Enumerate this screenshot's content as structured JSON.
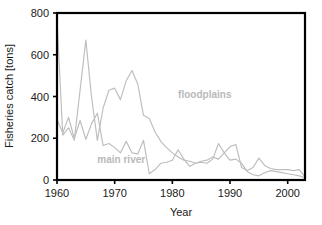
{
  "chart_data": {
    "type": "line",
    "title": "",
    "xlabel": "Year",
    "ylabel": "Fisheries catch [tons]",
    "xlim": [
      1960,
      2003
    ],
    "ylim": [
      0,
      800
    ],
    "xticks": [
      1960,
      1970,
      1980,
      1990,
      2000
    ],
    "yticks": [
      0,
      200,
      400,
      600,
      800
    ],
    "grid": false,
    "legend_position": "inline-annotation",
    "x": [
      1960,
      1961,
      1962,
      1963,
      1964,
      1965,
      1966,
      1967,
      1968,
      1969,
      1970,
      1971,
      1972,
      1973,
      1974,
      1975,
      1976,
      1977,
      1978,
      1979,
      1980,
      1981,
      1982,
      1983,
      1984,
      1985,
      1986,
      1987,
      1988,
      1989,
      1990,
      1991,
      1992,
      1993,
      1994,
      1995,
      1996,
      1997,
      1998,
      1999,
      2000,
      2001,
      2002,
      2003
    ],
    "series": [
      {
        "name": "floodplains",
        "color": "#bdbdbd",
        "label_x": 1981,
        "label_y": 395,
        "values": [
          770,
          215,
          250,
          190,
          430,
          670,
          395,
          190,
          345,
          430,
          440,
          385,
          475,
          525,
          460,
          310,
          295,
          230,
          185,
          155,
          130,
          110,
          95,
          90,
          80,
          85,
          80,
          100,
          175,
          130,
          95,
          100,
          80,
          40,
          25,
          20,
          35,
          45,
          40,
          35,
          30,
          25,
          20,
          10
        ]
      },
      {
        "name": "main river",
        "color": "#bdbdbd",
        "label_x": 1967,
        "label_y": 82,
        "values": [
          290,
          225,
          300,
          200,
          285,
          195,
          270,
          320,
          165,
          175,
          155,
          130,
          185,
          130,
          125,
          190,
          30,
          50,
          80,
          85,
          95,
          145,
          100,
          65,
          80,
          90,
          95,
          110,
          100,
          130,
          160,
          170,
          60,
          45,
          60,
          105,
          70,
          55,
          50,
          50,
          50,
          45,
          50,
          15
        ]
      }
    ]
  },
  "annotations": {
    "floodplains_label": "floodplains",
    "main_river_label": "main river"
  },
  "axes": {
    "x_title": "Year",
    "y_title": "Fisheries catch [tons]",
    "x_tick_labels": [
      "1960",
      "1970",
      "1980",
      "1990",
      "2000"
    ],
    "y_tick_labels": [
      "0",
      "200",
      "400",
      "600",
      "800"
    ]
  }
}
